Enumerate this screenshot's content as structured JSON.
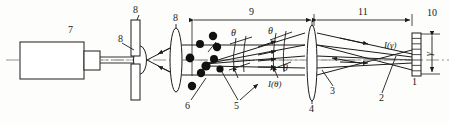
{
  "figure": {
    "type": "optical-scattering-diagram",
    "stroke_color": "#1c1c1c",
    "background": "#fdfdfb"
  },
  "dimensions": [
    {
      "id": "dim-9",
      "label": "9",
      "x1": 192,
      "x2": 313,
      "y": 18
    },
    {
      "id": "dim-11",
      "label": "11",
      "x1": 315,
      "x2": 412,
      "y": 18
    },
    {
      "id": "dim-gamma",
      "label": "γ",
      "orientation": "vertical",
      "x": 432,
      "y1": 34,
      "y2": 73
    }
  ],
  "callouts": [
    {
      "id": "callout-7",
      "label": "7",
      "x": 68,
      "y": 25,
      "target": "laser-source"
    },
    {
      "id": "callout-8a",
      "label": "8",
      "x": 118,
      "y": 36,
      "target": "beam-expander-lens"
    },
    {
      "id": "callout-8b",
      "label": "8",
      "x": 135,
      "y": 9,
      "target": "aperture-plate"
    },
    {
      "id": "callout-8c",
      "label": "8",
      "x": 174,
      "y": 17,
      "target": "collimating-lens"
    },
    {
      "id": "callout-6",
      "label": "6",
      "x": 185,
      "y": 104,
      "target": "particle"
    },
    {
      "id": "callout-5",
      "label": "5",
      "x": 234,
      "y": 104,
      "target": "scattered-rays"
    },
    {
      "id": "callout-4",
      "label": "4",
      "x": 310,
      "y": 108,
      "target": "fourier-lens"
    },
    {
      "id": "callout-3",
      "label": "3",
      "x": 330,
      "y": 88,
      "target": "converging-beam"
    },
    {
      "id": "callout-2",
      "label": "2",
      "x": 380,
      "y": 96,
      "target": "focused-ray"
    },
    {
      "id": "callout-1",
      "label": "1",
      "x": 414,
      "y": 82,
      "target": "detector-array"
    },
    {
      "id": "callout-10",
      "label": "10",
      "x": 428,
      "y": 12,
      "target": "detector-housing"
    }
  ],
  "angle_labels": [
    {
      "id": "theta-1",
      "text": "θ",
      "x": 231,
      "y": 30
    },
    {
      "id": "theta-2",
      "text": "θ",
      "x": 268,
      "y": 29
    },
    {
      "id": "theta-3",
      "text": "θ",
      "x": 283,
      "y": 66
    }
  ],
  "intensity_labels": [
    {
      "id": "i-theta",
      "text": "I(θ)",
      "x": 272,
      "y": 82
    },
    {
      "id": "i-gamma",
      "text": "I(γ)",
      "x": 386,
      "y": 44
    }
  ],
  "components": {
    "laser_source": "laser source body",
    "laser_neck": "laser output collar",
    "beam_expander_lens": "small converging lens",
    "aperture_plate": "pinhole aperture plate",
    "collimating_lens": "collimating lens",
    "particles": "scattering particle cloud",
    "fourier_lens": "Fourier transform lens",
    "detector_array": "multi-element ring detector"
  },
  "particles": [
    {
      "cx": 213,
      "cy": 36,
      "r": 4.2
    },
    {
      "cx": 200,
      "cy": 44,
      "r": 4.0
    },
    {
      "cx": 217,
      "cy": 47,
      "r": 4.2
    },
    {
      "cx": 190,
      "cy": 58,
      "r": 4.4
    },
    {
      "cx": 214,
      "cy": 59,
      "r": 4.0
    },
    {
      "cx": 206,
      "cy": 66,
      "r": 4.6
    },
    {
      "cx": 201,
      "cy": 73,
      "r": 4.2
    },
    {
      "cx": 192,
      "cy": 86,
      "r": 4.2
    },
    {
      "cx": 220,
      "cy": 69,
      "r": 3.6
    }
  ],
  "detector_segments": 8
}
